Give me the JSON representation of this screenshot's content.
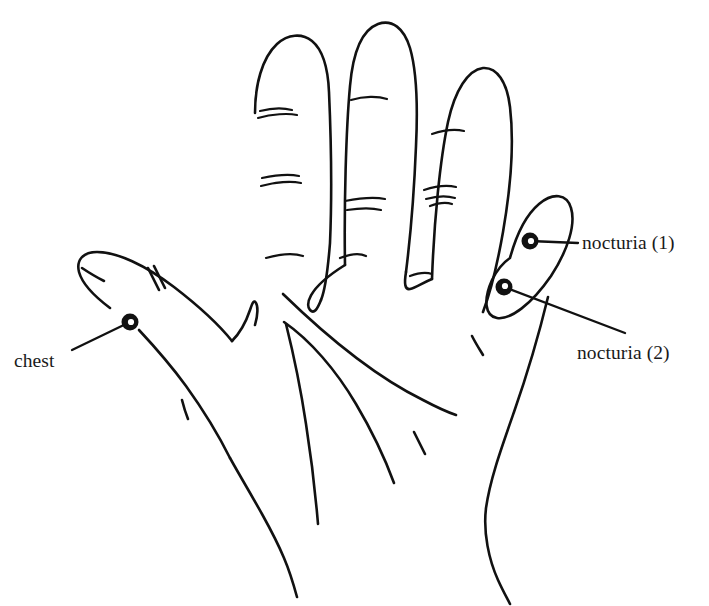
{
  "figure": {
    "kind": "hand-diagram",
    "background_color": "#ffffff",
    "ink_color": "#111111",
    "width": 709,
    "height": 606
  },
  "annotations": [
    {
      "id": "chest",
      "label": "chest",
      "marker": {
        "x": 130,
        "y": 322,
        "style": "ring"
      },
      "leader": {
        "from_x": 130,
        "from_y": 322,
        "to_x": 72,
        "to_y": 350
      },
      "label_pos": {
        "x": 14,
        "y": 350
      },
      "region": "thumb-base"
    },
    {
      "id": "nocturia-1",
      "label": "nocturia (1)",
      "marker": {
        "x": 530,
        "y": 241,
        "style": "ring"
      },
      "leader": {
        "from_x": 530,
        "from_y": 241,
        "to_x": 578,
        "to_y": 243
      },
      "label_pos": {
        "x": 582,
        "y": 232
      },
      "region": "little-finger-upper"
    },
    {
      "id": "nocturia-2",
      "label": "nocturia (2)",
      "marker": {
        "x": 504,
        "y": 287,
        "style": "ring"
      },
      "leader": {
        "from_x": 504,
        "from_y": 287,
        "to_x": 625,
        "to_y": 333
      },
      "label_pos": {
        "x": 577,
        "y": 342
      },
      "region": "little-finger-lower"
    }
  ],
  "marker_style": {
    "outer_radius": 8,
    "inner_radius": 3,
    "fill": "#111111",
    "inner_fill": "#ffffff"
  }
}
